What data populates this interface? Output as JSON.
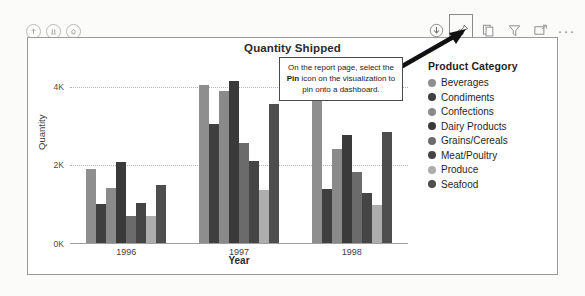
{
  "toolbar_left": {
    "icons": [
      {
        "name": "up-arrow-circle-icon",
        "glyph": "up"
      },
      {
        "name": "pause-circle-icon",
        "glyph": "pause"
      },
      {
        "name": "home-circle-icon",
        "glyph": "home"
      }
    ]
  },
  "viz_toolbar": {
    "icons": [
      {
        "name": "download-icon",
        "label": "Download"
      },
      {
        "name": "pin-icon",
        "label": "Pin",
        "highlighted": true
      },
      {
        "name": "copy-icon",
        "label": "Copy"
      },
      {
        "name": "filter-icon",
        "label": "Filter"
      },
      {
        "name": "focus-mode-icon",
        "label": "Focus mode"
      },
      {
        "name": "more-options-icon",
        "label": "More options"
      }
    ],
    "ellipsis": "···"
  },
  "callout": {
    "text_before": "On the report page, select the ",
    "emphasis": "Pin",
    "text_after": " icon on the visualization to pin onto a dashboard."
  },
  "legend": {
    "title": "Product Category",
    "items": [
      {
        "label": "Beverages",
        "color": "#8e8e8e"
      },
      {
        "label": "Condiments",
        "color": "#3f3f3f"
      },
      {
        "label": "Confections",
        "color": "#8a8a8a"
      },
      {
        "label": "Dairy Products",
        "color": "#3a3a3a"
      },
      {
        "label": "Grains/Cereals",
        "color": "#6b6b6b"
      },
      {
        "label": "Meat/Poultry",
        "color": "#454545"
      },
      {
        "label": "Produce",
        "color": "#adadad"
      },
      {
        "label": "Seafood",
        "color": "#4e4e4e"
      }
    ]
  },
  "chart_data": {
    "type": "bar",
    "title": "Quantity Shipped",
    "xlabel": "Year",
    "ylabel": "Quantity",
    "categories": [
      "1996",
      "1997",
      "1998"
    ],
    "ytick_labels": [
      "0K",
      "2K",
      "4K"
    ],
    "ytick_values": [
      0,
      2000,
      4000
    ],
    "ylim": [
      0,
      4600
    ],
    "grid": true,
    "legend_position": "right",
    "series": [
      {
        "name": "Beverages",
        "color": "#8e8e8e",
        "values": [
          1900,
          4050,
          3960
        ]
      },
      {
        "name": "Condiments",
        "color": "#3f3f3f",
        "values": [
          1020,
          3050,
          1390
        ]
      },
      {
        "name": "Confections",
        "color": "#8a8a8a",
        "values": [
          1430,
          3880,
          2420
        ]
      },
      {
        "name": "Dairy Products",
        "color": "#3a3a3a",
        "values": [
          2090,
          4140,
          2770
        ]
      },
      {
        "name": "Grains/Cereals",
        "color": "#6b6b6b",
        "values": [
          720,
          2560,
          1820
        ]
      },
      {
        "name": "Meat/Poultry",
        "color": "#454545",
        "values": [
          1050,
          2120,
          1290
        ]
      },
      {
        "name": "Produce",
        "color": "#adadad",
        "values": [
          700,
          1380,
          990
        ]
      },
      {
        "name": "Seafood",
        "color": "#4e4e4e",
        "values": [
          1500,
          3560,
          2840
        ]
      }
    ]
  }
}
